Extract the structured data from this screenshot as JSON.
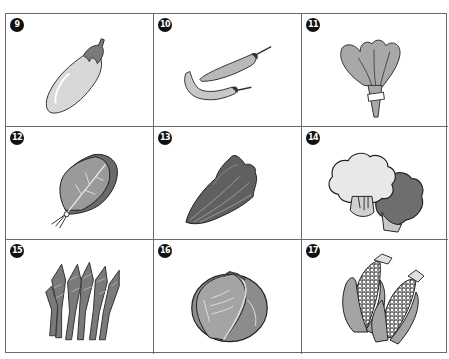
{
  "worksheet": {
    "items": [
      {
        "number": "9",
        "name": "eggplant"
      },
      {
        "number": "10",
        "name": "chili-peppers"
      },
      {
        "number": "11",
        "name": "leafy-greens-bunch"
      },
      {
        "number": "12",
        "name": "spinach-leaf"
      },
      {
        "number": "13",
        "name": "lettuce-romaine"
      },
      {
        "number": "14",
        "name": "cauliflower-broccoli"
      },
      {
        "number": "15",
        "name": "asparagus-greens-bunch"
      },
      {
        "number": "16",
        "name": "cabbage"
      },
      {
        "number": "17",
        "name": "corn-ears"
      }
    ],
    "colors": {
      "border": "#6a6a6a",
      "badge": "#111111",
      "light_fill": "#d8d8d8",
      "mid_fill": "#a0a0a0",
      "dark_fill": "#6e6e6e",
      "outline": "#222222"
    }
  }
}
